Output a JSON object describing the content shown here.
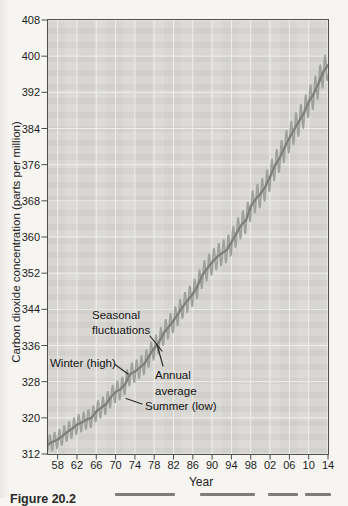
{
  "figure": {
    "caption_fragment": "Figure 20.2"
  },
  "colors": {
    "page_background": "#f6f5f1",
    "plot_background": "#dcdbd7",
    "gridline": "#efeeea",
    "axis_border": "#4f4f51",
    "seasonal_line": "#a0a09c",
    "annual_line": "#7e7e7a",
    "leader_line": "#2a2a2a",
    "text": "#1c1c1c"
  },
  "chart_data": {
    "type": "line",
    "title": "",
    "xlabel": "Year",
    "ylabel": "Carbon dioxide concentration (parts per million)",
    "x_range": [
      1956,
      2014
    ],
    "ylim": [
      312,
      408
    ],
    "grid": true,
    "x_tick_years": [
      1958,
      1962,
      1966,
      1970,
      1974,
      1978,
      1982,
      1986,
      1990,
      1994,
      1998,
      2002,
      2006,
      2010,
      2014
    ],
    "x_tick_labels": [
      "58",
      "62",
      "66",
      "70",
      "74",
      "78",
      "82",
      "86",
      "90",
      "94",
      "98",
      "02",
      "06",
      "10",
      "14"
    ],
    "y_ticks": [
      312,
      320,
      328,
      336,
      344,
      352,
      360,
      368,
      376,
      384,
      392,
      400,
      408
    ],
    "series": [
      {
        "name": "annual_average",
        "legend": "Annual average",
        "style": "smooth_dark_line",
        "start_year": 1956,
        "values": [
          314.1,
          314.7,
          315.2,
          316.0,
          316.9,
          317.6,
          318.5,
          319.0,
          319.6,
          320.0,
          321.4,
          322.2,
          323.0,
          324.6,
          325.7,
          326.3,
          327.5,
          329.7,
          330.2,
          331.1,
          332.0,
          333.8,
          335.4,
          336.8,
          338.8,
          340.1,
          341.5,
          343.1,
          344.7,
          346.1,
          347.4,
          349.2,
          351.6,
          353.1,
          354.4,
          355.6,
          356.4,
          357.1,
          358.8,
          360.8,
          362.6,
          363.7,
          366.7,
          368.4,
          369.5,
          371.1,
          373.3,
          375.8,
          377.5,
          379.8,
          381.9,
          383.8,
          385.6,
          387.4,
          389.9,
          391.6,
          393.9,
          396.5,
          398.0
        ]
      },
      {
        "name": "monthly_seasonal",
        "legend": "Seasonal fluctuations",
        "style": "light_oscillating_line",
        "derived_from": "annual_average",
        "samples_per_year": 12,
        "seasonal": {
          "amplitude_start_ppm": 1.9,
          "amplitude_end_ppm": 3.2,
          "peak_year_fraction": 0.37
        }
      }
    ],
    "annotations": {
      "seasonal": {
        "line1": "Seasonal",
        "line2": "fluctuations"
      },
      "winter": {
        "label": "Winter (high)"
      },
      "annual": {
        "line1": "Annual",
        "line2": "average"
      },
      "summer": {
        "label": "Summer (low)"
      }
    }
  }
}
